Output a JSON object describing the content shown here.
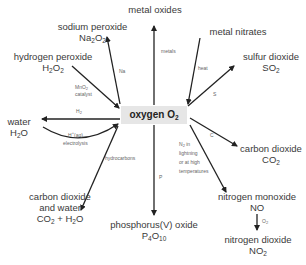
{
  "center": {
    "name": "oxygen",
    "formula": "O",
    "sub": "2"
  },
  "nodes": {
    "metal_oxides": {
      "name": "metal oxides"
    },
    "metal_nitrates": {
      "name": "metal nitrates"
    },
    "sodium_peroxide": {
      "name": "sodium peroxide",
      "formula_parts": [
        "Na",
        "2",
        "O",
        "2"
      ]
    },
    "hydrogen_peroxide": {
      "name": "hydrogen peroxide",
      "formula_parts": [
        "H",
        "2",
        "O",
        "2"
      ]
    },
    "sulfur_dioxide": {
      "name": "sulfur dioxide",
      "formula_parts": [
        "SO",
        "2"
      ]
    },
    "water": {
      "name": "water",
      "formula_parts": [
        "H",
        "2",
        "O"
      ]
    },
    "carbon_dioxide": {
      "name": "carbon dioxide",
      "formula_parts": [
        "CO",
        "2"
      ]
    },
    "co2_water": {
      "name1": "carbon dioxide",
      "name2": "and water",
      "formula_parts": [
        "CO",
        "2",
        " + H",
        "2",
        "O"
      ]
    },
    "phosphorus_oxide": {
      "name": "phosphorus(V) oxide",
      "formula_parts": [
        "P",
        "4",
        "O",
        "10"
      ]
    },
    "nitrogen_monoxide": {
      "name": "nitrogen monoxide",
      "formula": "NO"
    },
    "nitrogen_dioxide": {
      "name": "nitrogen dioxide",
      "formula_parts": [
        "NO",
        "2"
      ]
    }
  },
  "labels": {
    "metals": "metals",
    "heat": "heat",
    "na": "Na",
    "mno2_a": "MnO",
    "mno2_sub": "2",
    "catalyst": "catalyst",
    "h2": "H",
    "h2_sub": "2",
    "s": "S",
    "hplus": "H",
    "hplus_sup": "+",
    "aq": "(aq)",
    "electrolysis": "electrolysis",
    "c": "C",
    "hydrocarbons": "hydrocarbons",
    "p": "P",
    "n2": "N",
    "n2_sub": "2",
    "in": " in",
    "lightning": "lightning",
    "or_at_high": "or at high",
    "temperatures": "temperatures",
    "o2": "O",
    "o2_sub": "2"
  },
  "colors": {
    "arrow": "#222222",
    "center_bg": "#e6e6e6",
    "text": "#3a3a3a",
    "label": "#666666"
  }
}
